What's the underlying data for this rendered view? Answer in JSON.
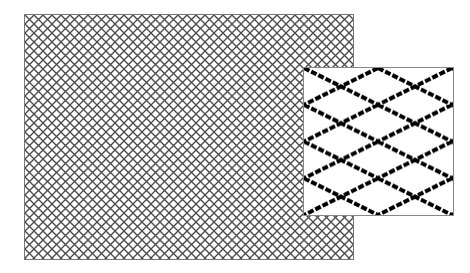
{
  "figure": {
    "main_panel": {
      "pattern": "diamond-lattice",
      "cell_width_px": 9,
      "cell_height_px": 9,
      "line_color": "#555555",
      "background": "#ffffff"
    },
    "inset": {
      "pattern": "diamond-lattice-magnified",
      "columns": 2,
      "rows": 4,
      "line_color": "#000000",
      "background": "#ffffff"
    }
  }
}
